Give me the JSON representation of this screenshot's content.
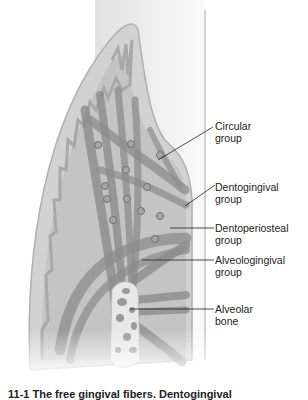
{
  "figure": {
    "type": "anatomical-illustration",
    "colors": {
      "background": "#ffffff",
      "gingiva": "#cfcfcf",
      "gingiva_edge": "#b5b5b5",
      "epithelium": "#dcdcdc",
      "tooth": "#ededed",
      "fibers": "#8f8f8f",
      "fibers_dark": "#6e6e6e",
      "bone": "#e6e6e6",
      "leader_line": "#222222"
    },
    "labels": [
      {
        "line1": "Circular",
        "line2": "group"
      },
      {
        "line1": "Dentogingival",
        "line2": "group"
      },
      {
        "line1": "Dentoperiosteal",
        "line2": "group"
      },
      {
        "line1": "Alveologingival",
        "line2": "group"
      },
      {
        "line1": "Alveolar",
        "line2": "bone"
      }
    ]
  },
  "caption": {
    "text": "11-1 The free gingival fibers. Dentogingival"
  }
}
